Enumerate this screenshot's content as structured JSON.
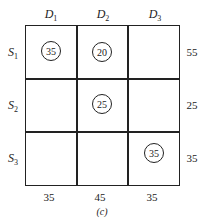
{
  "columns": [
    {
      "name": "D",
      "sub": "1"
    },
    {
      "name": "D",
      "sub": "2"
    },
    {
      "name": "D",
      "sub": "3"
    }
  ],
  "rows": [
    {
      "name": "S",
      "sub": "1",
      "supply": "55"
    },
    {
      "name": "S",
      "sub": "2",
      "supply": "25"
    },
    {
      "name": "S",
      "sub": "3",
      "supply": "35"
    }
  ],
  "demand": [
    "35",
    "45",
    "35"
  ],
  "allocations": [
    {
      "row": 1,
      "col": 1,
      "value": "35"
    },
    {
      "row": 1,
      "col": 2,
      "value": "20"
    },
    {
      "row": 2,
      "col": 2,
      "value": "25"
    },
    {
      "row": 3,
      "col": 3,
      "value": "35"
    }
  ],
  "caption": "(c)"
}
